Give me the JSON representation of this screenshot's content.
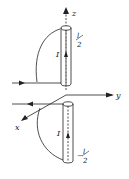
{
  "diagram": {
    "labels": {
      "z_axis": "z",
      "y_axis": "y",
      "x_axis": "x",
      "upper_current": "I",
      "lower_current": "I",
      "upper_half_length_num": "l",
      "upper_half_length_den": "2",
      "lower_half_length_sign": "−",
      "lower_half_length_num": "l",
      "lower_half_length_den": "2"
    },
    "colors": {
      "stroke": "#222222",
      "background": "#ffffff"
    }
  }
}
